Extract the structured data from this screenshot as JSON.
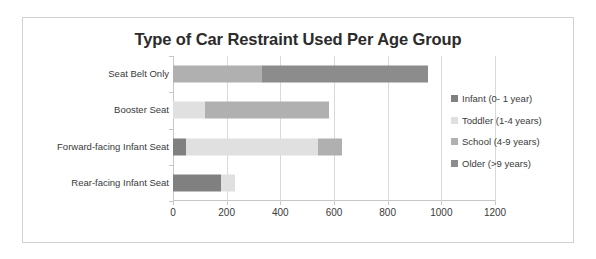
{
  "chart_data": {
    "type": "bar",
    "orientation": "horizontal",
    "stacked": true,
    "title": "Type of Car Restraint Used Per Age Group",
    "xlabel": "",
    "ylabel": "",
    "xlim": [
      0,
      1200
    ],
    "grid": true,
    "legend_position": "right",
    "categories": [
      "Rear-facing Infant Seat",
      "Forward-facing Infant Seat",
      "Booster Seat",
      "Seat Belt Only"
    ],
    "xticks": [
      0,
      200,
      400,
      600,
      800,
      1000,
      1200
    ],
    "series": [
      {
        "name": "Infant (0- 1 year)",
        "color": "#808080",
        "values": [
          180,
          50,
          0,
          0
        ]
      },
      {
        "name": "Toddler (1-4 years)",
        "color": "#e0e0e0",
        "values": [
          50,
          490,
          120,
          0
        ]
      },
      {
        "name": "School (4-9 years)",
        "color": "#b0b0b0",
        "values": [
          0,
          90,
          460,
          330
        ]
      },
      {
        "name": "Older (>9 years)",
        "color": "#8c8c8c",
        "values": [
          0,
          0,
          0,
          620
        ]
      }
    ],
    "totals": [
      230,
      630,
      580,
      950
    ]
  },
  "legend": {
    "items": [
      {
        "label": "Infant (0- 1 year)",
        "color": "#808080"
      },
      {
        "label": "Toddler (1-4 years)",
        "color": "#e0e0e0"
      },
      {
        "label": "School (4-9 years)",
        "color": "#b0b0b0"
      },
      {
        "label": "Older (>9 years)",
        "color": "#8c8c8c"
      }
    ]
  },
  "style": {
    "frame_border": "#d2d2d2",
    "grid_color": "#d9d9d9",
    "axis_color": "#c6c6c6",
    "text_color": "#3a3a3a",
    "title_color": "#2b2b2b",
    "background": "#ffffff"
  }
}
